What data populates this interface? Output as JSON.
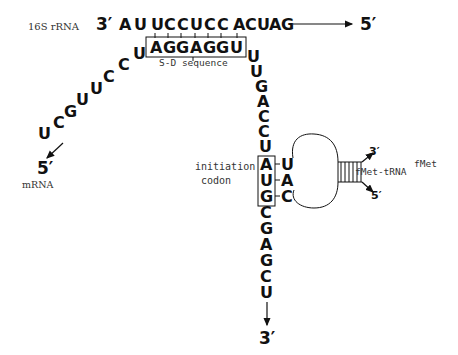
{
  "labels": {
    "rrna": "16S rRNA",
    "mrna": "mRNA",
    "sd": "S-D sequence",
    "init1": "initiation",
    "init2": "codon",
    "trna": "fMet-tRNA",
    "trna_sup": "fMet"
  },
  "rrna": {
    "three_prime": "3′",
    "five_prime": "5′",
    "seq": [
      "A",
      "U",
      "U",
      "C",
      "C",
      "U",
      "C",
      "C",
      "A",
      "C",
      "U",
      "A",
      "G"
    ]
  },
  "sd_box": {
    "seq": [
      "A",
      "G",
      "G",
      "A",
      "G",
      "G",
      "U"
    ]
  },
  "mrna": {
    "five_prime": "5′",
    "three_prime": "3′",
    "left_arm": [
      "U",
      "C",
      "G",
      "U",
      "U",
      "C",
      "C",
      "U"
    ],
    "right_arm": [
      "U",
      "U",
      "G",
      "A",
      "C",
      "C",
      "U"
    ],
    "codon": [
      "A",
      "U",
      "G"
    ],
    "downstream": [
      "C",
      "G",
      "A",
      "G",
      "C",
      "U"
    ]
  },
  "trna": {
    "anticodon": [
      "U",
      "A",
      "C"
    ],
    "three_prime": "3′",
    "five_prime": "5′"
  }
}
